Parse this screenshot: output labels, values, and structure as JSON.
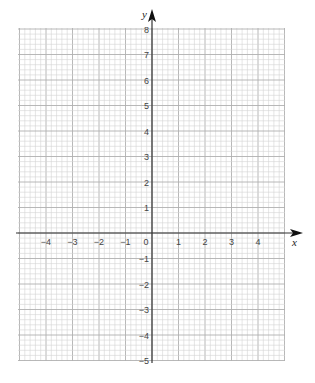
{
  "chart_data": {
    "type": "scatter",
    "title": "",
    "xlabel": "x",
    "ylabel": "y",
    "xlim": [
      -5,
      5
    ],
    "ylim": [
      -5,
      8
    ],
    "x_ticks": [
      -4,
      -3,
      -2,
      -1,
      0,
      1,
      2,
      3,
      4
    ],
    "y_ticks": [
      -5,
      -4,
      -3,
      -2,
      -1,
      1,
      2,
      3,
      4,
      5,
      6,
      7,
      8
    ],
    "grid": true,
    "minor_divisions_per_unit": 5,
    "series": []
  },
  "layout": {
    "origin_px": [
      152,
      233
    ],
    "unit_px_x": 26.5,
    "unit_px_y": 25.5,
    "grid_left": 18,
    "grid_right": 285,
    "grid_top": 28,
    "grid_bottom": 361
  },
  "colors": {
    "minor_grid": "#d4d4d4",
    "major_grid": "#b0b0b0",
    "axis": "#333333",
    "label": "#444444"
  }
}
